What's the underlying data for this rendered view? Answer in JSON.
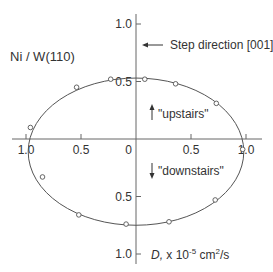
{
  "chart_data": {
    "type": "scatter",
    "subtype": "polar-ellipse-fit",
    "title": "Ni / W(110)",
    "annotations": {
      "step_direction": "Step direction [001]",
      "upstairs": "\"upstairs\"",
      "downstairs": "\"downstairs\""
    },
    "axis_label": {
      "prefix": "D,",
      "unit_text": " x 10",
      "exponent": "-5",
      "unit_rest": " cm",
      "unit_exp": "2",
      "unit_tail": "/s"
    },
    "x_ticks": [
      {
        "value": -1.0,
        "label": "1.0"
      },
      {
        "value": -0.5,
        "label": "0.5"
      },
      {
        "value": 0,
        "label": "0"
      },
      {
        "value": 0.5,
        "label": "0.5"
      },
      {
        "value": 1.0,
        "label": "1.0"
      }
    ],
    "y_ticks": [
      {
        "value": 1.0,
        "label": "1.0"
      },
      {
        "value": 0.5,
        "label": "0.5"
      },
      {
        "value": -0.5,
        "label": "0.5"
      },
      {
        "value": -1.0,
        "label": "1.0"
      }
    ],
    "xlim": [
      -1.15,
      1.15
    ],
    "ylim": [
      -1.1,
      1.1
    ],
    "ellipse_fit": {
      "cx": 0.0,
      "cy": -0.11,
      "rx": 0.98,
      "ry": 0.64
    },
    "points": [
      {
        "x": -0.96,
        "y": 0.1
      },
      {
        "x": -0.54,
        "y": 0.45
      },
      {
        "x": -0.23,
        "y": 0.52
      },
      {
        "x": 0.08,
        "y": 0.52
      },
      {
        "x": 0.36,
        "y": 0.48
      },
      {
        "x": 0.73,
        "y": 0.31
      },
      {
        "x": 0.97,
        "y": -0.09
      },
      {
        "x": 0.72,
        "y": -0.53
      },
      {
        "x": 0.3,
        "y": -0.72
      },
      {
        "x": -0.09,
        "y": -0.74
      },
      {
        "x": -0.52,
        "y": -0.66
      },
      {
        "x": -0.85,
        "y": -0.33
      }
    ],
    "grid": false,
    "colors": {
      "line": "#555555",
      "axis": "#666666",
      "text": "#333333"
    }
  }
}
